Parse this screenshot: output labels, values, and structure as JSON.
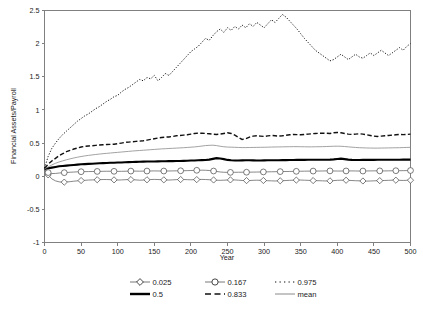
{
  "chart_data": {
    "type": "line",
    "title": "",
    "xlabel": "Year",
    "ylabel": "Financial Assets/Payroll",
    "xlim": [
      0,
      500
    ],
    "ylim": [
      -1,
      2.5
    ],
    "xticks": [
      0,
      50,
      100,
      150,
      200,
      250,
      300,
      350,
      400,
      450,
      500
    ],
    "xtick_labels": [
      "0",
      "50",
      "100",
      "150",
      "200",
      "250",
      "300",
      "350",
      "400",
      "450",
      "500"
    ],
    "yticks": [
      -1,
      -0.5,
      0,
      0.5,
      1,
      1.5,
      2,
      2.5
    ],
    "ytick_labels": [
      "-1",
      "-0.5",
      "0",
      "0.5",
      "1",
      "1.5",
      "2",
      "2.5"
    ],
    "grid": false,
    "legend_position": "bottom",
    "x": [
      0,
      5,
      10,
      15,
      20,
      25,
      30,
      35,
      40,
      45,
      50,
      55,
      60,
      65,
      70,
      75,
      80,
      85,
      90,
      95,
      100,
      105,
      110,
      115,
      120,
      125,
      130,
      135,
      140,
      145,
      150,
      155,
      160,
      165,
      170,
      175,
      180,
      185,
      190,
      195,
      200,
      205,
      210,
      215,
      220,
      225,
      230,
      235,
      240,
      245,
      250,
      255,
      260,
      265,
      270,
      275,
      280,
      285,
      290,
      295,
      300,
      305,
      310,
      315,
      320,
      325,
      330,
      335,
      340,
      345,
      350,
      355,
      360,
      365,
      370,
      375,
      380,
      385,
      390,
      395,
      400,
      405,
      410,
      415,
      420,
      425,
      430,
      435,
      440,
      445,
      450,
      455,
      460,
      465,
      470,
      475,
      480,
      485,
      490,
      495,
      500
    ],
    "series": [
      {
        "name": "0.025",
        "label": "0.025",
        "style": "solid-thin-diamond-marker",
        "color": "#555555",
        "marker": "diamond",
        "values": [
          0.1,
          0.02,
          -0.04,
          -0.07,
          -0.085,
          -0.09,
          -0.088,
          -0.082,
          -0.075,
          -0.07,
          -0.065,
          -0.062,
          -0.058,
          -0.056,
          -0.054,
          -0.052,
          -0.05,
          -0.05,
          -0.052,
          -0.055,
          -0.058,
          -0.056,
          -0.053,
          -0.05,
          -0.052,
          -0.056,
          -0.06,
          -0.058,
          -0.054,
          -0.05,
          -0.048,
          -0.05,
          -0.053,
          -0.056,
          -0.058,
          -0.055,
          -0.052,
          -0.05,
          -0.05,
          -0.052,
          -0.054,
          -0.052,
          -0.05,
          -0.048,
          -0.05,
          -0.053,
          -0.056,
          -0.06,
          -0.062,
          -0.06,
          -0.057,
          -0.055,
          -0.056,
          -0.06,
          -0.064,
          -0.066,
          -0.065,
          -0.062,
          -0.06,
          -0.062,
          -0.065,
          -0.068,
          -0.07,
          -0.072,
          -0.07,
          -0.068,
          -0.065,
          -0.062,
          -0.06,
          -0.058,
          -0.058,
          -0.06,
          -0.062,
          -0.065,
          -0.067,
          -0.068,
          -0.07,
          -0.072,
          -0.07,
          -0.066,
          -0.062,
          -0.06,
          -0.06,
          -0.062,
          -0.065,
          -0.068,
          -0.07,
          -0.072,
          -0.074,
          -0.072,
          -0.07,
          -0.068,
          -0.066,
          -0.064,
          -0.062,
          -0.06,
          -0.06,
          -0.062,
          -0.064,
          -0.062,
          -0.06
        ]
      },
      {
        "name": "0.167",
        "label": "0.167",
        "style": "solid-thin-circle-marker",
        "color": "#555555",
        "marker": "circle",
        "values": [
          0.105,
          0.055,
          0.04,
          0.042,
          0.048,
          0.052,
          0.056,
          0.06,
          0.063,
          0.066,
          0.068,
          0.069,
          0.07,
          0.071,
          0.072,
          0.073,
          0.074,
          0.075,
          0.075,
          0.074,
          0.073,
          0.074,
          0.075,
          0.077,
          0.078,
          0.077,
          0.076,
          0.077,
          0.078,
          0.079,
          0.08,
          0.079,
          0.078,
          0.078,
          0.079,
          0.08,
          0.081,
          0.082,
          0.083,
          0.084,
          0.086,
          0.088,
          0.09,
          0.091,
          0.09,
          0.086,
          0.08,
          0.072,
          0.064,
          0.06,
          0.058,
          0.058,
          0.059,
          0.06,
          0.06,
          0.06,
          0.061,
          0.062,
          0.063,
          0.064,
          0.065,
          0.066,
          0.067,
          0.068,
          0.069,
          0.07,
          0.071,
          0.072,
          0.073,
          0.074,
          0.075,
          0.076,
          0.077,
          0.077,
          0.078,
          0.078,
          0.079,
          0.08,
          0.08,
          0.079,
          0.078,
          0.078,
          0.079,
          0.08,
          0.08,
          0.079,
          0.078,
          0.078,
          0.079,
          0.08,
          0.081,
          0.081,
          0.08,
          0.08,
          0.081,
          0.082,
          0.083,
          0.083,
          0.084,
          0.085,
          0.086
        ]
      },
      {
        "name": "0.975",
        "label": "0.975",
        "style": "dotted",
        "color": "#111111",
        "marker": "none",
        "values": [
          0.12,
          0.3,
          0.42,
          0.5,
          0.57,
          0.63,
          0.68,
          0.73,
          0.78,
          0.83,
          0.87,
          0.91,
          0.94,
          0.98,
          1.02,
          1.05,
          1.09,
          1.13,
          1.16,
          1.2,
          1.22,
          1.27,
          1.31,
          1.34,
          1.38,
          1.42,
          1.46,
          1.44,
          1.49,
          1.47,
          1.52,
          1.44,
          1.49,
          1.55,
          1.52,
          1.58,
          1.64,
          1.7,
          1.76,
          1.82,
          1.88,
          1.92,
          1.96,
          2.02,
          2.08,
          2.05,
          2.12,
          2.18,
          2.22,
          2.17,
          2.24,
          2.2,
          2.26,
          2.22,
          2.28,
          2.24,
          2.3,
          2.26,
          2.32,
          2.28,
          2.24,
          2.3,
          2.36,
          2.32,
          2.38,
          2.44,
          2.4,
          2.34,
          2.28,
          2.22,
          2.15,
          2.08,
          2.02,
          1.96,
          1.9,
          1.86,
          1.82,
          1.78,
          1.74,
          1.76,
          1.8,
          1.84,
          1.8,
          1.76,
          1.8,
          1.84,
          1.8,
          1.78,
          1.82,
          1.86,
          1.82,
          1.86,
          1.9,
          1.86,
          1.82,
          1.86,
          1.9,
          1.94,
          1.9,
          1.96,
          2.0
        ]
      },
      {
        "name": "0.5",
        "label": "0.5",
        "style": "solid-thick",
        "color": "#000000",
        "marker": "none",
        "values": [
          0.11,
          0.12,
          0.13,
          0.14,
          0.15,
          0.155,
          0.16,
          0.165,
          0.17,
          0.175,
          0.18,
          0.183,
          0.186,
          0.189,
          0.192,
          0.195,
          0.198,
          0.2,
          0.202,
          0.204,
          0.206,
          0.208,
          0.21,
          0.212,
          0.214,
          0.216,
          0.218,
          0.22,
          0.221,
          0.222,
          0.223,
          0.224,
          0.225,
          0.226,
          0.227,
          0.228,
          0.229,
          0.23,
          0.232,
          0.234,
          0.236,
          0.238,
          0.24,
          0.242,
          0.244,
          0.25,
          0.262,
          0.272,
          0.268,
          0.258,
          0.246,
          0.24,
          0.238,
          0.238,
          0.239,
          0.24,
          0.24,
          0.239,
          0.238,
          0.238,
          0.239,
          0.24,
          0.24,
          0.24,
          0.241,
          0.242,
          0.243,
          0.244,
          0.245,
          0.246,
          0.246,
          0.247,
          0.248,
          0.248,
          0.248,
          0.248,
          0.248,
          0.249,
          0.25,
          0.254,
          0.26,
          0.265,
          0.258,
          0.25,
          0.246,
          0.245,
          0.245,
          0.246,
          0.246,
          0.247,
          0.247,
          0.248,
          0.248,
          0.248,
          0.248,
          0.248,
          0.249,
          0.249,
          0.25,
          0.25,
          0.25
        ]
      },
      {
        "name": "0.833",
        "label": "0.833",
        "style": "dashed",
        "color": "#111111",
        "marker": "none",
        "values": [
          0.12,
          0.18,
          0.23,
          0.27,
          0.31,
          0.34,
          0.37,
          0.39,
          0.41,
          0.425,
          0.44,
          0.45,
          0.455,
          0.46,
          0.465,
          0.47,
          0.475,
          0.478,
          0.48,
          0.482,
          0.49,
          0.5,
          0.51,
          0.515,
          0.52,
          0.525,
          0.53,
          0.535,
          0.545,
          0.555,
          0.565,
          0.575,
          0.585,
          0.59,
          0.592,
          0.6,
          0.61,
          0.615,
          0.62,
          0.625,
          0.635,
          0.645,
          0.65,
          0.648,
          0.645,
          0.64,
          0.635,
          0.63,
          0.635,
          0.645,
          0.655,
          0.645,
          0.62,
          0.585,
          0.555,
          0.565,
          0.59,
          0.605,
          0.61,
          0.605,
          0.6,
          0.608,
          0.615,
          0.61,
          0.605,
          0.61,
          0.618,
          0.625,
          0.63,
          0.628,
          0.625,
          0.63,
          0.635,
          0.64,
          0.645,
          0.648,
          0.65,
          0.648,
          0.645,
          0.655,
          0.66,
          0.655,
          0.645,
          0.635,
          0.63,
          0.635,
          0.64,
          0.635,
          0.625,
          0.615,
          0.605,
          0.6,
          0.605,
          0.61,
          0.615,
          0.62,
          0.625,
          0.63,
          0.628,
          0.63,
          0.635
        ]
      },
      {
        "name": "mean",
        "label": "mean",
        "style": "solid-thin-gray",
        "color": "#8a8a8a",
        "marker": "none",
        "values": [
          0.11,
          0.14,
          0.17,
          0.195,
          0.215,
          0.232,
          0.248,
          0.262,
          0.275,
          0.287,
          0.297,
          0.306,
          0.314,
          0.321,
          0.328,
          0.334,
          0.34,
          0.345,
          0.35,
          0.355,
          0.36,
          0.365,
          0.37,
          0.375,
          0.38,
          0.384,
          0.388,
          0.392,
          0.396,
          0.4,
          0.404,
          0.408,
          0.412,
          0.415,
          0.418,
          0.421,
          0.424,
          0.427,
          0.43,
          0.434,
          0.438,
          0.442,
          0.448,
          0.455,
          0.462,
          0.466,
          0.468,
          0.462,
          0.452,
          0.444,
          0.44,
          0.438,
          0.436,
          0.434,
          0.432,
          0.432,
          0.433,
          0.434,
          0.435,
          0.436,
          0.437,
          0.438,
          0.44,
          0.441,
          0.442,
          0.443,
          0.444,
          0.445,
          0.446,
          0.446,
          0.445,
          0.444,
          0.443,
          0.443,
          0.444,
          0.445,
          0.446,
          0.448,
          0.45,
          0.452,
          0.453,
          0.452,
          0.448,
          0.443,
          0.438,
          0.434,
          0.43,
          0.428,
          0.426,
          0.425,
          0.424,
          0.424,
          0.425,
          0.426,
          0.427,
          0.428,
          0.429,
          0.43,
          0.432,
          0.434,
          0.436
        ]
      }
    ],
    "marker_x": [
      5,
      27,
      50,
      72,
      95,
      118,
      140,
      163,
      186,
      208,
      231,
      254,
      276,
      299,
      322,
      344,
      367,
      390,
      412,
      435,
      458,
      480,
      500
    ]
  },
  "legend": {
    "entries": [
      {
        "label": "0.025",
        "icon": "diamond-marker-line-icon"
      },
      {
        "label": "0.167",
        "icon": "circle-marker-line-icon"
      },
      {
        "label": "0.975",
        "icon": "dotted-line-icon"
      },
      {
        "label": "0.5",
        "icon": "thick-solid-line-icon"
      },
      {
        "label": "0.833",
        "icon": "dashed-line-icon"
      },
      {
        "label": "mean",
        "icon": "thin-gray-line-icon"
      }
    ]
  },
  "colors": {
    "axis": "#808080",
    "text": "#1a1a1a",
    "background": "#ffffff",
    "mean_line": "#8a8a8a",
    "median_line": "#000000"
  }
}
